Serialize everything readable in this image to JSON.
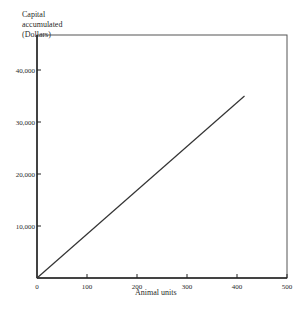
{
  "chart_data": {
    "type": "line",
    "title": "",
    "xlabel": "Animal units",
    "ylabel": "Capital accumulated (Dollars)",
    "ylabel_lines": [
      "Capital",
      "accumulated",
      "(Dollars)"
    ],
    "xlim": [
      0,
      500
    ],
    "ylim": [
      0,
      45000
    ],
    "x_ticks": [
      0,
      100,
      200,
      300,
      400,
      500
    ],
    "x_tick_labels": [
      "0",
      "100",
      "200",
      "300",
      "400",
      "500"
    ],
    "y_ticks": [
      10000,
      20000,
      30000,
      40000
    ],
    "y_tick_labels": [
      "10,000",
      "20,000",
      "30,000",
      "40,000"
    ],
    "grid": false,
    "legend": null,
    "series": [
      {
        "name": "Capital accumulated",
        "x": [
          0,
          415
        ],
        "y": [
          0,
          35000
        ]
      }
    ]
  }
}
